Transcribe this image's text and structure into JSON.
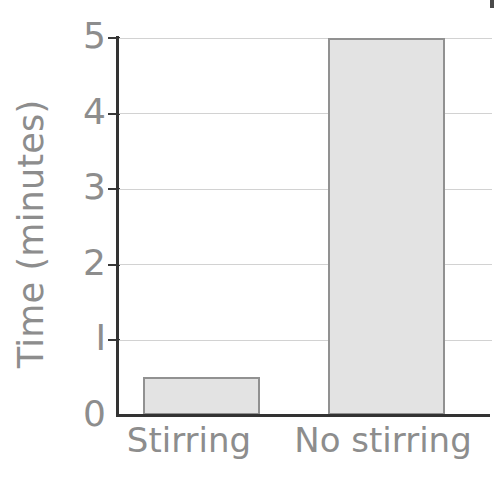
{
  "chart_data": {
    "type": "bar",
    "title": "",
    "xlabel": "",
    "ylabel": "Time (minutes)",
    "categories": [
      "Stirring",
      "No stirring"
    ],
    "values": [
      0.5,
      5
    ],
    "ylim": [
      0,
      5
    ],
    "yticks": [
      0,
      1,
      2,
      3,
      4,
      5
    ],
    "ytick_labels": [
      "0",
      "I",
      "2",
      "3",
      "4",
      "5"
    ],
    "grid": true,
    "grid_axis": "y",
    "legend": false,
    "legend_position": "none",
    "series": [
      {
        "name": "Time",
        "values": [
          0.5,
          5
        ]
      }
    ],
    "bar_fill_color": "#e3e3e3",
    "bar_border_color": "#919191",
    "gridline_color": "#d2d2d2",
    "axis_color": "#333333",
    "text_color": "#8d8d8d",
    "background_color": "#ffffff"
  }
}
